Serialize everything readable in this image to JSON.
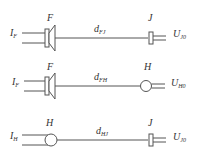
{
  "diagrams": [
    {
      "source_label": "F",
      "input": {
        "main": "I",
        "sub": "F"
      },
      "distance": {
        "main": "d",
        "sub": "FJ"
      },
      "target_label": "J",
      "output": {
        "main": "U",
        "sub": "J0"
      },
      "source_device": "speaker",
      "target_device": "connector"
    },
    {
      "source_label": "F",
      "input": {
        "main": "I",
        "sub": "F"
      },
      "distance": {
        "main": "d",
        "sub": "FH"
      },
      "target_label": "H",
      "output": {
        "main": "U",
        "sub": "H0"
      },
      "source_device": "speaker",
      "target_device": "circle"
    },
    {
      "source_label": "H",
      "input": {
        "main": "I",
        "sub": "H"
      },
      "distance": {
        "main": "d",
        "sub": "HJ"
      },
      "target_label": "J",
      "output": {
        "main": "U",
        "sub": "J0"
      },
      "source_device": "circle",
      "target_device": "connector"
    }
  ],
  "colors": {
    "line": "#555555",
    "text": "#333333",
    "background": "#ffffff"
  }
}
